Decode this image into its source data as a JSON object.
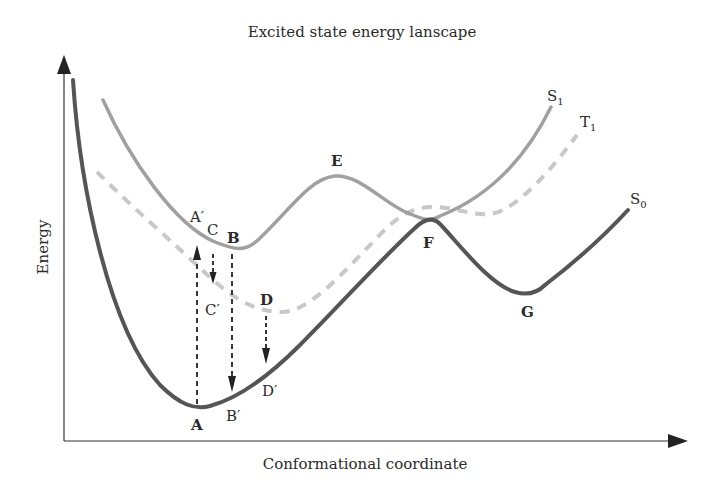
{
  "title": "Excited state energy lanscape",
  "axes": {
    "x_label": "Conformational coordinate",
    "y_label": "Energy"
  },
  "curves": {
    "S0": {
      "name": "S",
      "sub": "0",
      "style": "solid",
      "color": "#555555"
    },
    "S1": {
      "name": "S",
      "sub": "1",
      "style": "solid",
      "color": "#9e9e9e"
    },
    "T1": {
      "name": "T",
      "sub": "1",
      "style": "dashed",
      "color": "#c4c4c4"
    }
  },
  "points": {
    "A": "A",
    "A_prime": "A′",
    "B": "B",
    "B_prime": "B′",
    "C": "C",
    "C_prime": "C′",
    "D": "D",
    "D_prime": "D′",
    "E": "E",
    "F": "F",
    "G": "G"
  },
  "transitions": [
    {
      "from": "A",
      "to": "A′",
      "direction": "up",
      "label": "excitation"
    },
    {
      "from": "C",
      "to": "C′",
      "direction": "down",
      "label": "intersystem crossing"
    },
    {
      "from": "B",
      "to": "B′",
      "direction": "down",
      "label": "emission"
    },
    {
      "from": "D",
      "to": "D′",
      "direction": "down",
      "label": "phosphorescence"
    }
  ]
}
